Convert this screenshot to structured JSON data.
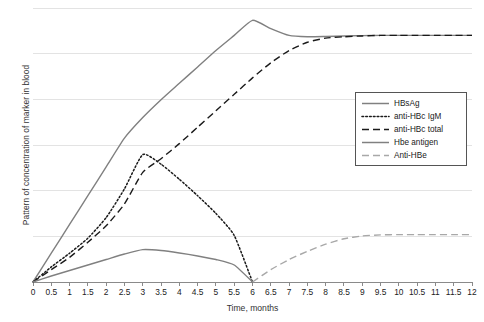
{
  "chart_data": {
    "type": "line",
    "title": "",
    "xlabel": "Time, months",
    "ylabel": "Pattern of concentration of marker in blood",
    "xlim": [
      0,
      12
    ],
    "ylim": [
      0,
      1
    ],
    "grid": "horizontal",
    "legend_position": "center-right",
    "x_tick_labels": [
      "0",
      "0.5",
      "1",
      "1.5",
      "2",
      "2.5",
      "3",
      "3.5",
      "4",
      "4.5",
      "5",
      "5.5",
      "6",
      "6.5",
      "7",
      "7.5",
      "8",
      "8.5",
      "9",
      "9.5",
      "10",
      "10.5",
      "11",
      "11.5",
      "12"
    ],
    "y_tick_labels": [],
    "x": [
      0,
      0.5,
      1,
      1.5,
      2,
      2.5,
      3,
      3.5,
      4,
      4.5,
      5,
      5.5,
      6,
      6.5,
      7,
      7.5,
      8,
      8.5,
      9,
      9.5,
      10,
      10.5,
      11,
      11.5,
      12
    ],
    "series": [
      {
        "name": "HBsAg",
        "style": "solid",
        "color": "#808080",
        "values": [
          0.0,
          0.105,
          0.21,
          0.315,
          0.42,
          0.525,
          0.6,
          0.665,
          0.725,
          0.785,
          0.845,
          0.9,
          0.955,
          0.925,
          0.9,
          0.895,
          0.896,
          0.898,
          0.899,
          0.9,
          0.9,
          0.9,
          0.9,
          0.9,
          0.9
        ]
      },
      {
        "name": "anti-HBc IgM",
        "style": "dotted",
        "color": "#1a1a1a",
        "values": [
          0.0,
          0.055,
          0.105,
          0.16,
          0.235,
          0.34,
          0.465,
          0.43,
          0.375,
          0.315,
          0.25,
          0.17,
          0.0,
          null,
          null,
          null,
          null,
          null,
          null,
          null,
          null,
          null,
          null,
          null,
          null
        ]
      },
      {
        "name": "anti-HBc total",
        "style": "dashed",
        "color": "#1a1a1a",
        "values": [
          0.0,
          0.045,
          0.09,
          0.145,
          0.205,
          0.285,
          0.4,
          0.45,
          0.505,
          0.565,
          0.625,
          0.685,
          0.745,
          0.8,
          0.845,
          0.875,
          0.89,
          0.895,
          0.898,
          0.9,
          0.9,
          0.9,
          0.9,
          0.9,
          0.9
        ]
      },
      {
        "name": "Hbe antigen",
        "style": "solid",
        "color": "#808080",
        "values": [
          0.0,
          0.022,
          0.042,
          0.062,
          0.082,
          0.102,
          0.118,
          0.115,
          0.106,
          0.095,
          0.082,
          0.062,
          0.0,
          null,
          null,
          null,
          null,
          null,
          null,
          null,
          null,
          null,
          null,
          null,
          null
        ]
      },
      {
        "name": "Anti-HBe",
        "style": "dashed",
        "color": "#a8a8a8",
        "values": [
          null,
          null,
          null,
          null,
          null,
          null,
          null,
          null,
          null,
          null,
          null,
          null,
          0.0,
          0.045,
          0.082,
          0.112,
          0.138,
          0.158,
          0.168,
          0.172,
          0.173,
          0.173,
          0.173,
          0.173,
          0.173
        ]
      }
    ]
  },
  "legend": {
    "items": [
      {
        "label": "HBsAg"
      },
      {
        "label": "anti-HBc IgM"
      },
      {
        "label": "anti-HBc total"
      },
      {
        "label": "Hbe antigen"
      },
      {
        "label": "Anti-HBe"
      }
    ]
  }
}
